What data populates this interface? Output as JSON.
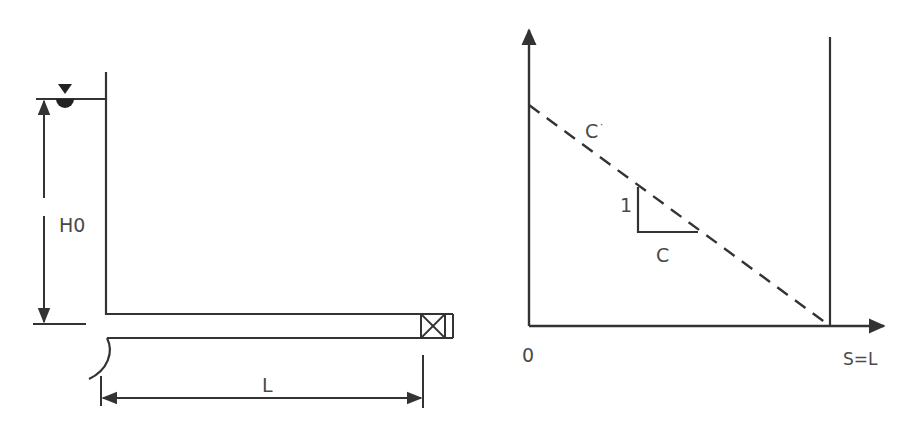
{
  "colors": {
    "line": "#333333",
    "text": "#4a4a4a",
    "background": "#ffffff"
  },
  "left_diagram": {
    "head_label": "H0",
    "length_label": "L",
    "water_surface_icon": "water-level-triangle-icon",
    "valve_icon": "valve-box-icon"
  },
  "right_diagram": {
    "origin_label": "0",
    "x_end_label": "S=L",
    "line_label": "C",
    "line_label_superscript": "·",
    "slope_rise_label": "1",
    "slope_run_label": "C"
  }
}
